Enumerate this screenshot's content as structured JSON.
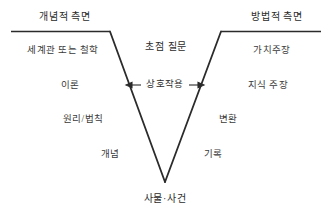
{
  "diagram": {
    "title_left": "개념적 측면",
    "title_right": "방법적 측면",
    "center_top": "초점 질문",
    "center_middle": "상호작용",
    "vertex_label": "사물·사건",
    "left_items": [
      "세계관 또는 철학",
      "이론",
      "원리/법칙",
      "개념"
    ],
    "right_items": [
      "가치주장",
      "지식 주장",
      "변환",
      "기록"
    ],
    "colors": {
      "line": "#2b2b2b",
      "text": "#3a3a3a",
      "background": "#ffffff"
    }
  }
}
